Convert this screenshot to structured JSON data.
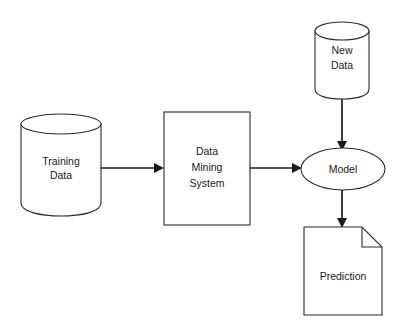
{
  "diagram": {
    "background_color": "#ffffff",
    "line_color": "#2b2b2b",
    "arrow_color": "#1a1a1a",
    "text_color": "#1a1a1a",
    "nodes": {
      "training_data": {
        "label_line1": "Training",
        "label_line2": "Data",
        "shape": "cylinder"
      },
      "data_mining_system": {
        "label_line1": "Data",
        "label_line2": "Mining",
        "label_line3": "System",
        "shape": "rectangle"
      },
      "new_data": {
        "label_line1": "New",
        "label_line2": "Data",
        "shape": "cylinder"
      },
      "model": {
        "label": "Model",
        "shape": "ellipse"
      },
      "prediction": {
        "label": "Prediction",
        "shape": "document"
      }
    },
    "edges": [
      {
        "from": "training_data",
        "to": "data_mining_system",
        "direction": "right"
      },
      {
        "from": "data_mining_system",
        "to": "model",
        "direction": "right"
      },
      {
        "from": "new_data",
        "to": "model",
        "direction": "down"
      },
      {
        "from": "model",
        "to": "prediction",
        "direction": "down"
      }
    ]
  }
}
